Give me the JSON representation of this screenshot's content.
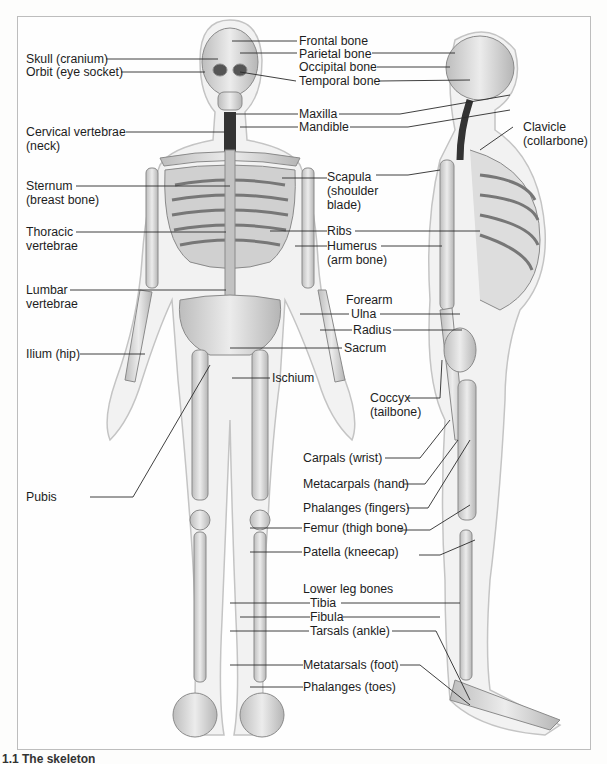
{
  "figure": {
    "title": "The skeleton",
    "caption_partial": "1.1  The skeleton",
    "frame_color": "#bdbdbd",
    "bone_color": "#d9d9d9",
    "body_outline_color": "#c8c8c8"
  },
  "labels": {
    "left": [
      {
        "id": "skull",
        "text": "Skull (cranium)"
      },
      {
        "id": "orbit",
        "text": "Orbit (eye socket)"
      },
      {
        "id": "cervical_1",
        "text": "Cervical vertebrae"
      },
      {
        "id": "cervical_2",
        "text": "(neck)"
      },
      {
        "id": "sternum_1",
        "text": "Sternum"
      },
      {
        "id": "sternum_2",
        "text": "(breast bone)"
      },
      {
        "id": "thoracic_1",
        "text": "Thoracic"
      },
      {
        "id": "thoracic_2",
        "text": "vertebrae"
      },
      {
        "id": "lumbar_1",
        "text": "Lumbar"
      },
      {
        "id": "lumbar_2",
        "text": "vertebrae"
      },
      {
        "id": "ilium",
        "text": "Ilium (hip)"
      },
      {
        "id": "pubis",
        "text": "Pubis"
      }
    ],
    "center": [
      {
        "id": "frontal",
        "text": "Frontal bone"
      },
      {
        "id": "parietal",
        "text": "Parietal bone"
      },
      {
        "id": "occipital",
        "text": "Occipital bone"
      },
      {
        "id": "temporal",
        "text": "Temporal bone"
      },
      {
        "id": "maxilla",
        "text": "Maxilla"
      },
      {
        "id": "mandible",
        "text": "Mandible"
      },
      {
        "id": "scapula_1",
        "text": "Scapula"
      },
      {
        "id": "scapula_2",
        "text": "(shoulder"
      },
      {
        "id": "scapula_3",
        "text": "blade)"
      },
      {
        "id": "ribs",
        "text": "Ribs"
      },
      {
        "id": "humerus_1",
        "text": "Humerus"
      },
      {
        "id": "humerus_2",
        "text": "(arm bone)"
      },
      {
        "id": "forearm",
        "text": "Forearm"
      },
      {
        "id": "ulna",
        "text": "Ulna"
      },
      {
        "id": "radius",
        "text": "Radius"
      },
      {
        "id": "sacrum",
        "text": "Sacrum"
      },
      {
        "id": "ischium",
        "text": "Ischium"
      },
      {
        "id": "coccyx_1",
        "text": "Coccyx"
      },
      {
        "id": "coccyx_2",
        "text": "(tailbone)"
      },
      {
        "id": "carpals",
        "text": "Carpals (wrist)"
      },
      {
        "id": "metacarpals",
        "text": "Metacarpals (hand)"
      },
      {
        "id": "phalanges_fingers",
        "text": "Phalanges (fingers)"
      },
      {
        "id": "femur",
        "text": "Femur (thigh bone)"
      },
      {
        "id": "patella",
        "text": "Patella (kneecap)"
      },
      {
        "id": "lower_leg",
        "text": "Lower leg bones"
      },
      {
        "id": "tibia",
        "text": "Tibia"
      },
      {
        "id": "fibula",
        "text": "Fibula"
      },
      {
        "id": "tarsals",
        "text": "Tarsals (ankle)"
      },
      {
        "id": "metatarsals",
        "text": "Metatarsals (foot)"
      },
      {
        "id": "phalanges_toes",
        "text": "Phalanges (toes)"
      }
    ],
    "right": [
      {
        "id": "clavicle_1",
        "text": "Clavicle"
      },
      {
        "id": "clavicle_2",
        "text": "(collarbone)"
      }
    ]
  }
}
